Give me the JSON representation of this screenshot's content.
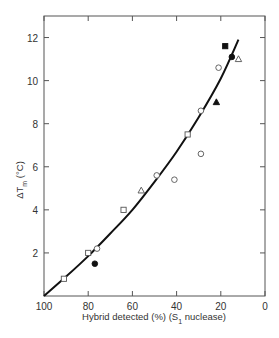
{
  "chart_data": {
    "type": "scatter",
    "title": "",
    "xlabel": "Hybrid detected (%) (S1 nuclease)",
    "xlabel_parts": {
      "main": "Hybrid detected (%) (S",
      "sub": "1",
      "tail": " nuclease)"
    },
    "ylabel": "ΔTm (°C)",
    "ylabel_parts": {
      "pre": "ΔT",
      "sub": "m",
      "tail": " (°C)"
    },
    "xlim": [
      100,
      0
    ],
    "ylim": [
      0,
      13
    ],
    "x_ticks": [
      100,
      80,
      60,
      40,
      20,
      0
    ],
    "y_ticks": [
      2,
      4,
      6,
      8,
      10,
      12
    ],
    "grid": false,
    "legend": null,
    "series": [
      {
        "name": "open-square",
        "marker": "square",
        "filled": false,
        "points": [
          [
            91,
            0.8
          ],
          [
            80,
            2.0
          ],
          [
            64,
            4.0
          ],
          [
            35,
            7.5
          ]
        ]
      },
      {
        "name": "open-circle",
        "marker": "circle",
        "filled": false,
        "points": [
          [
            76,
            2.2
          ],
          [
            49,
            5.6
          ],
          [
            41,
            5.4
          ],
          [
            29,
            6.6
          ],
          [
            29,
            8.6
          ],
          [
            21,
            10.6
          ]
        ]
      },
      {
        "name": "open-triangle",
        "marker": "triangle",
        "filled": false,
        "points": [
          [
            56,
            4.9
          ],
          [
            12,
            11.0
          ]
        ]
      },
      {
        "name": "filled-circle",
        "marker": "circle",
        "filled": true,
        "points": [
          [
            77,
            1.5
          ],
          [
            15,
            11.1
          ]
        ]
      },
      {
        "name": "filled-triangle",
        "marker": "triangle",
        "filled": true,
        "points": [
          [
            22,
            9.0
          ]
        ]
      },
      {
        "name": "filled-square",
        "marker": "square",
        "filled": true,
        "points": [
          [
            18,
            11.6
          ]
        ]
      }
    ],
    "fit_curve": {
      "points": [
        [
          100,
          0
        ],
        [
          90,
          0.9
        ],
        [
          80,
          1.85
        ],
        [
          70,
          2.9
        ],
        [
          60,
          4.0
        ],
        [
          50,
          5.3
        ],
        [
          40,
          6.7
        ],
        [
          30,
          8.3
        ],
        [
          20,
          10.1
        ],
        [
          12,
          11.9
        ]
      ]
    }
  }
}
